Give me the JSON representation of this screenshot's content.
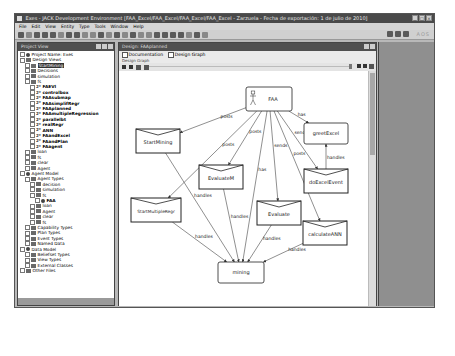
{
  "window": {
    "title": "Exes - JACK Development Environment [FAA_Excel/FAA_Excel/FAA_Excel/FAA_Excel - Zarzuela - Fecha de exportación: 1 de julio de 2010]",
    "controls": [
      "_",
      "□",
      "×"
    ]
  },
  "menubar": {
    "items": [
      "File",
      "Edit",
      "View",
      "Entity",
      "Type",
      "Tools",
      "Window",
      "Help"
    ]
  },
  "toolbar": {
    "perspective_label": "AOS"
  },
  "project_panel": {
    "title": "Project View",
    "tree": [
      {
        "level": 0,
        "label": "Project Name: Exes",
        "icon": "agent",
        "bold": false
      },
      {
        "level": 0,
        "label": "Design Views",
        "icon": "folder"
      },
      {
        "level": 1,
        "label": "StartMining",
        "icon": "folder",
        "selected": true
      },
      {
        "level": 1,
        "label": "Decisions",
        "icon": "folder"
      },
      {
        "level": 1,
        "label": "simulation",
        "icon": "folder"
      },
      {
        "level": 1,
        "label": "fs",
        "icon": "folder"
      },
      {
        "level": 2,
        "label": "FAEVI",
        "icon": "cap",
        "bold": true
      },
      {
        "level": 2,
        "label": "controlbox",
        "icon": "cap",
        "bold": true
      },
      {
        "level": 2,
        "label": "FAAsubmap",
        "icon": "cap",
        "bold": true
      },
      {
        "level": 2,
        "label": "FAAsimplifRegr",
        "icon": "cap",
        "bold": true
      },
      {
        "level": 2,
        "label": "FAAplanned",
        "icon": "cap",
        "bold": true
      },
      {
        "level": 2,
        "label": "FAAmultipleRegression",
        "icon": "cap",
        "bold": true
      },
      {
        "level": 2,
        "label": "parallelbt",
        "icon": "cap",
        "bold": true
      },
      {
        "level": 2,
        "label": "realRegr",
        "icon": "cap",
        "bold": true
      },
      {
        "level": 2,
        "label": "ANN",
        "icon": "cap",
        "bold": true
      },
      {
        "level": 2,
        "label": "FAandExcel",
        "icon": "cap",
        "bold": true
      },
      {
        "level": 2,
        "label": "FAandPlan",
        "icon": "cap",
        "bold": true
      },
      {
        "level": 2,
        "label": "FAagent",
        "icon": "cap",
        "bold": true
      },
      {
        "level": 1,
        "label": "loan",
        "icon": "folder"
      },
      {
        "level": 1,
        "label": "fs",
        "icon": "folder"
      },
      {
        "level": 1,
        "label": "clear",
        "icon": "folder"
      },
      {
        "level": 1,
        "label": "Agent",
        "icon": "folder"
      },
      {
        "level": 0,
        "label": "Agent Model",
        "icon": "agent"
      },
      {
        "level": 1,
        "label": "Agent Types",
        "icon": "folder"
      },
      {
        "level": 2,
        "label": "decision",
        "icon": "folder"
      },
      {
        "level": 2,
        "label": "simulation",
        "icon": "folder"
      },
      {
        "level": 2,
        "label": "fs",
        "icon": "folder"
      },
      {
        "level": 3,
        "label": "FAA",
        "icon": "agent",
        "bold": true
      },
      {
        "level": 2,
        "label": "loan",
        "icon": "folder"
      },
      {
        "level": 2,
        "label": "Agent",
        "icon": "folder"
      },
      {
        "level": 2,
        "label": "clear",
        "icon": "folder"
      },
      {
        "level": 2,
        "label": "fs",
        "icon": "folder"
      },
      {
        "level": 1,
        "label": "Capability Types",
        "icon": "folder"
      },
      {
        "level": 1,
        "label": "Plan Types",
        "icon": "folder"
      },
      {
        "level": 1,
        "label": "Event Types",
        "icon": "folder"
      },
      {
        "level": 1,
        "label": "Named Data",
        "icon": "folder"
      },
      {
        "level": 0,
        "label": "Data Model",
        "icon": "agent"
      },
      {
        "level": 1,
        "label": "Beliefset Types",
        "icon": "folder"
      },
      {
        "level": 1,
        "label": "View Types",
        "icon": "folder"
      },
      {
        "level": 1,
        "label": "External Classes",
        "icon": "folder"
      },
      {
        "level": 0,
        "label": "Other Files",
        "icon": "folder"
      }
    ]
  },
  "design_panel": {
    "title": "Design: FAAplanned",
    "options": [
      {
        "label": "Documentation",
        "checked": false
      },
      {
        "label": "Design Graph",
        "checked": false
      }
    ],
    "section_label": "Design Graph",
    "diagram": {
      "nodes": [
        {
          "id": "FAA",
          "label": "FAA",
          "type": "agent",
          "x": 127,
          "y": 16,
          "w": 46,
          "h": 24
        },
        {
          "id": "StartMining",
          "label": "StartMining",
          "type": "event",
          "x": 17,
          "y": 58,
          "w": 44,
          "h": 24
        },
        {
          "id": "EvaluateM",
          "label": "EvaluateM",
          "type": "event",
          "x": 80,
          "y": 94,
          "w": 44,
          "h": 24
        },
        {
          "id": "greetExcel",
          "label": "greetExcel",
          "type": "plan",
          "x": 185,
          "y": 52,
          "w": 44,
          "h": 21
        },
        {
          "id": "doExcelEvent",
          "label": "doExcelEvent",
          "type": "event",
          "x": 185,
          "y": 98,
          "w": 44,
          "h": 24
        },
        {
          "id": "StartMultipleRegr",
          "label": "StartMultipleRegr",
          "type": "event",
          "x": 12,
          "y": 127,
          "w": 50,
          "h": 24
        },
        {
          "id": "Evaluate",
          "label": "Evaluate",
          "type": "event",
          "x": 138,
          "y": 130,
          "w": 44,
          "h": 24
        },
        {
          "id": "calculateANN",
          "label": "calculateANN",
          "type": "event",
          "x": 184,
          "y": 150,
          "w": 44,
          "h": 24
        },
        {
          "id": "mining",
          "label": "mining",
          "type": "plan",
          "x": 99,
          "y": 191,
          "w": 46,
          "h": 21
        }
      ],
      "edges": [
        {
          "from": "FAA",
          "to": "StartMining",
          "label": "posts"
        },
        {
          "from": "FAA",
          "to": "EvaluateM",
          "label": "posts"
        },
        {
          "from": "FAA",
          "to": "greetExcel",
          "label": "has"
        },
        {
          "from": "FAA",
          "to": "doExcelEvent",
          "label": "sends"
        },
        {
          "from": "FAA",
          "to": "Evaluate",
          "label": "sends"
        },
        {
          "from": "FAA",
          "to": "calculateANN",
          "label": "posts"
        },
        {
          "from": "FAA",
          "to": "mining",
          "label": "has"
        },
        {
          "from": "FAA",
          "to": "StartMultipleRegr",
          "label": "posts"
        },
        {
          "from": "doExcelEvent",
          "to": "greetExcel",
          "label": "handles"
        },
        {
          "from": "StartMining",
          "to": "mining",
          "label": "handles"
        },
        {
          "from": "EvaluateM",
          "to": "mining",
          "label": "handles"
        },
        {
          "from": "StartMultipleRegr",
          "to": "mining",
          "label": "handles"
        },
        {
          "from": "Evaluate",
          "to": "mining",
          "label": "handles"
        },
        {
          "from": "calculateANN",
          "to": "mining",
          "label": "handles"
        }
      ]
    }
  },
  "colors": {
    "titlebar": "#4a4a4a",
    "panel_border": "#444444",
    "app_bg": "#b8b8b8",
    "dark_area": "#8f8f8f"
  }
}
